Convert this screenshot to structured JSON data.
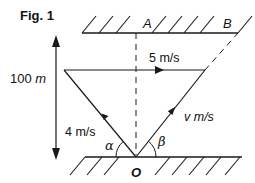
{
  "figure": {
    "title": "Fig. 1",
    "width_label": {
      "value": "100",
      "unit": "m"
    },
    "points": {
      "top_bank_A": "A",
      "top_bank_B": "B",
      "origin": "O"
    },
    "vectors": {
      "river_velocity": "5 m/s",
      "boat_velocity_left": "4 m/s",
      "boat_velocity_right": "v m/s"
    },
    "angles": {
      "left": "α",
      "right": "β"
    },
    "colors": {
      "stroke": "#1a1a1a",
      "background": "#ffffff"
    }
  }
}
